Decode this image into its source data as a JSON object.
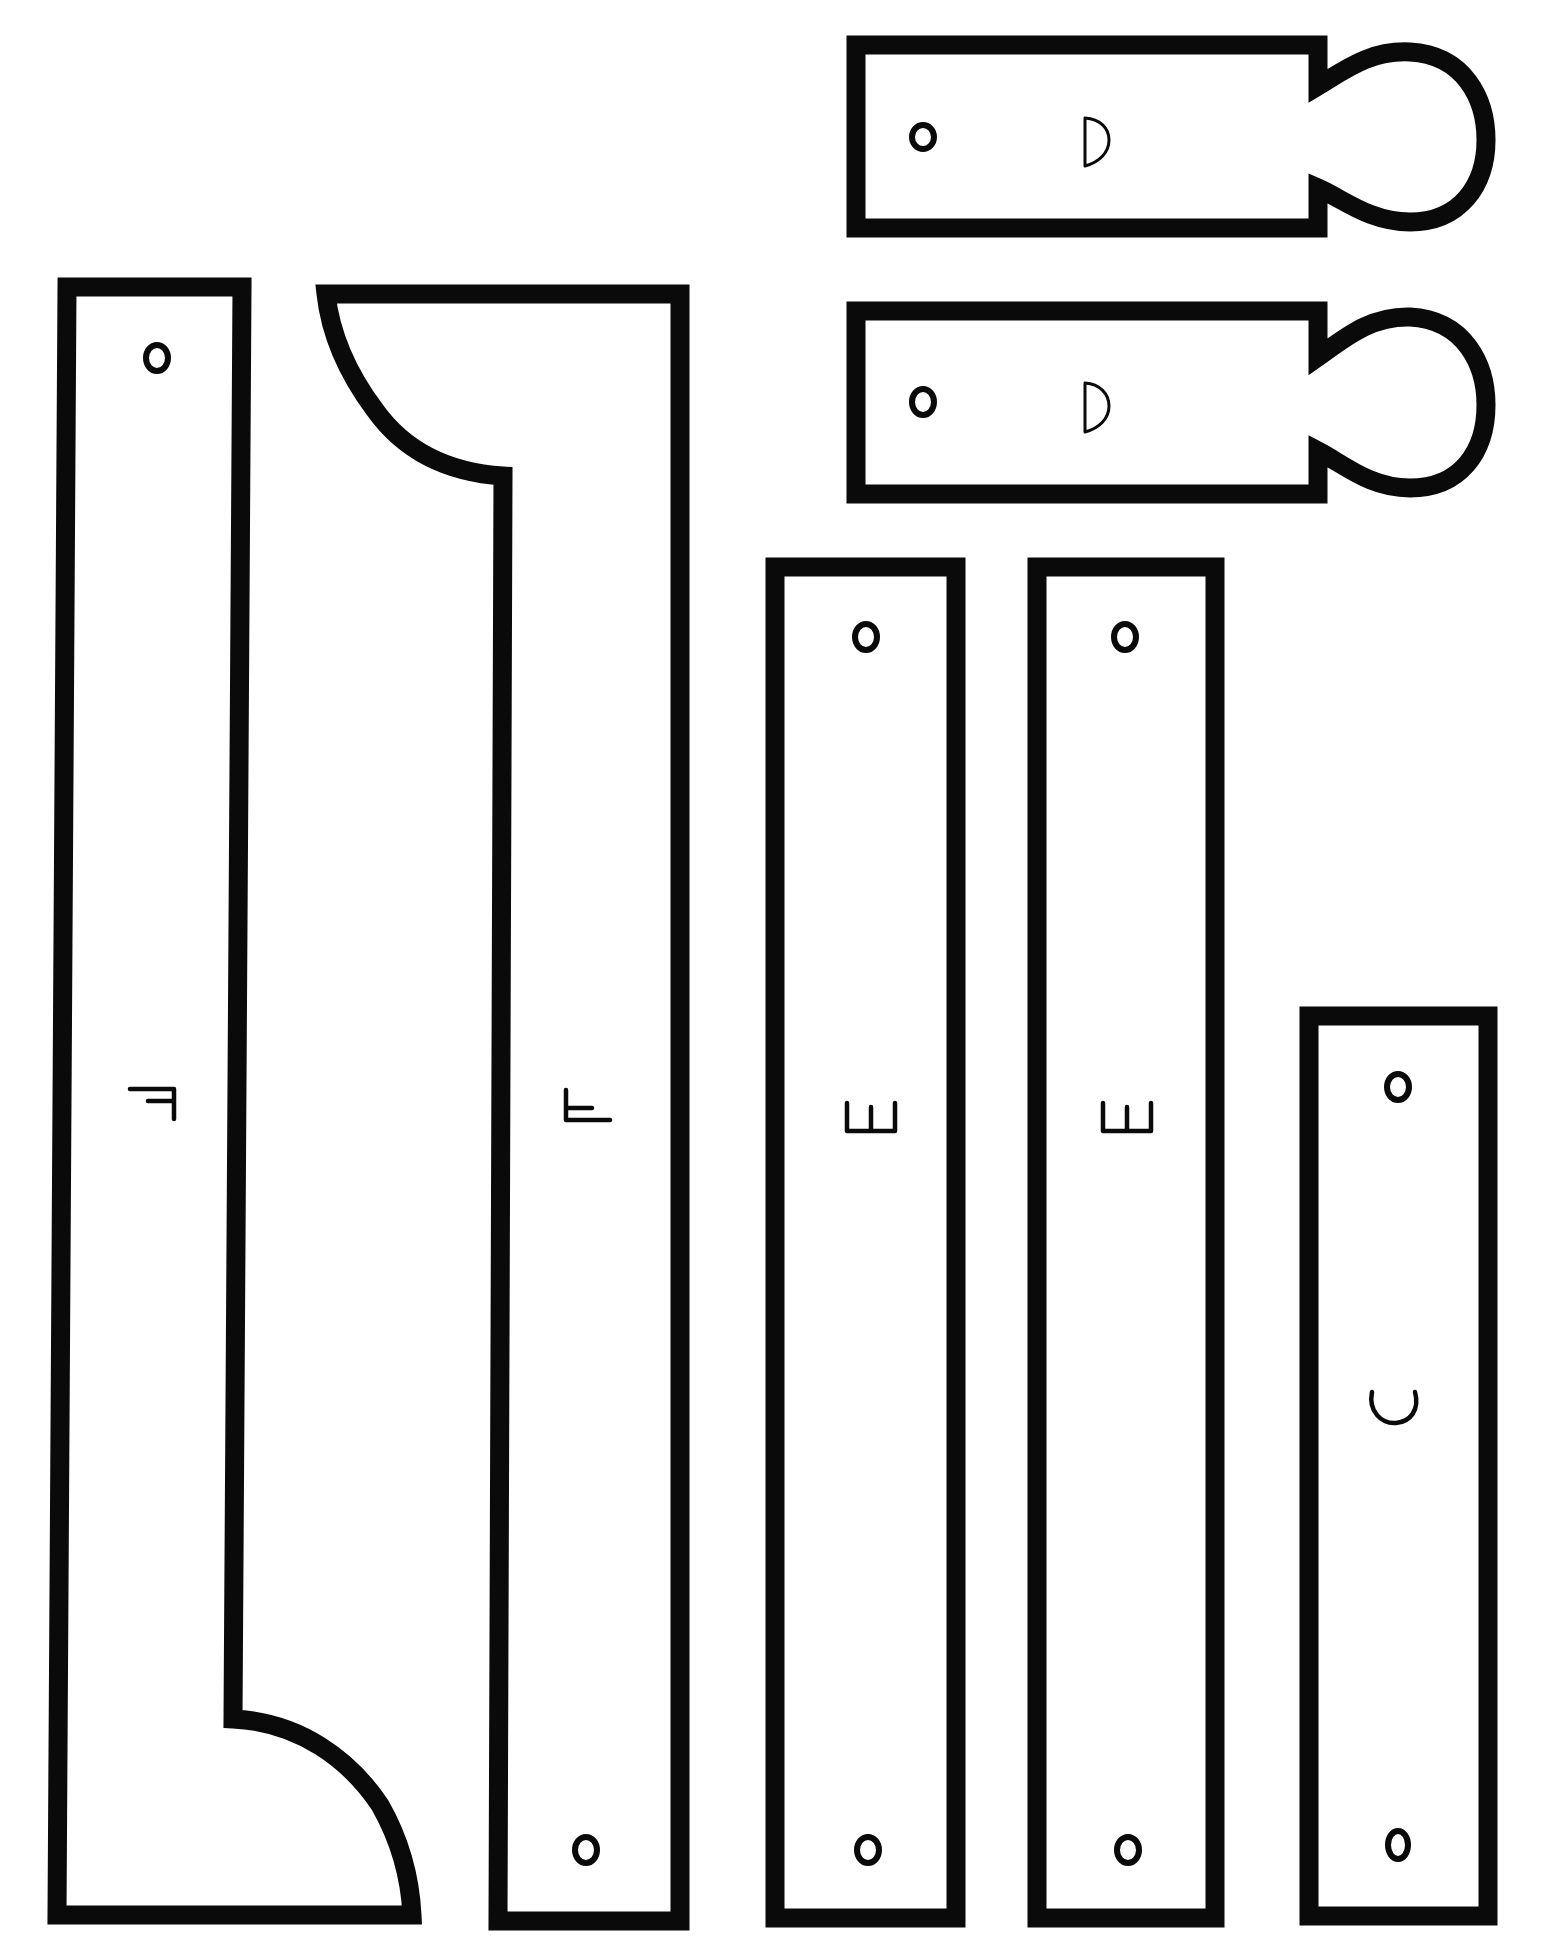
{
  "sheet": {
    "title": "Cut-out template pieces",
    "ink_color": "#0a0a0a",
    "paper_color": "#ffffff"
  },
  "pieces": [
    {
      "id": "F-left",
      "label": "F",
      "label_rotation": "90cw",
      "holes": 1,
      "shape": "long bar with quarter-round foot at bottom right"
    },
    {
      "id": "F-right",
      "label": "F",
      "label_rotation": "90ccw",
      "holes": 1,
      "shape": "long bar with quarter-round head at top left"
    },
    {
      "id": "E-1",
      "label": "E",
      "label_rotation": "90ccw",
      "holes": 2,
      "shape": "long rectangle"
    },
    {
      "id": "E-2",
      "label": "E",
      "label_rotation": "90ccw",
      "holes": 2,
      "shape": "long rectangle"
    },
    {
      "id": "C",
      "label": "C",
      "label_rotation": "90ccw",
      "holes": 2,
      "shape": "rectangle"
    },
    {
      "id": "D-1",
      "label": "D",
      "label_rotation": "none",
      "holes": 1,
      "shape": "rectangle with rounded bulb tab on right"
    },
    {
      "id": "D-2",
      "label": "D",
      "label_rotation": "none",
      "holes": 1,
      "shape": "rectangle with rounded bulb tab on right"
    }
  ]
}
